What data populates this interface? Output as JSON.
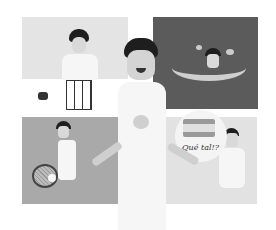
{
  "illustration": {
    "description": "Boy imagining four hobbies: science experiment, swimming, tennis, and speaking Spanish",
    "panels": [
      {
        "position": "top-left",
        "activity": "science experiment"
      },
      {
        "position": "top-right",
        "activity": "swimming underwater"
      },
      {
        "position": "bottom-left",
        "activity": "tennis"
      },
      {
        "position": "bottom-right",
        "activity": "speaking Spanish"
      }
    ],
    "speech_bubble": {
      "text": "Qué tal!?",
      "flag": "Spain"
    },
    "colors": {
      "top_left_bg": "#e4e4e4",
      "top_right_bg": "#5b5b5b",
      "bottom_left_bg": "#a9a9a9",
      "bottom_right_bg": "#e2e2e2",
      "flag_red": "#9a9a9a",
      "flag_yellow": "#e0e0e0"
    }
  }
}
